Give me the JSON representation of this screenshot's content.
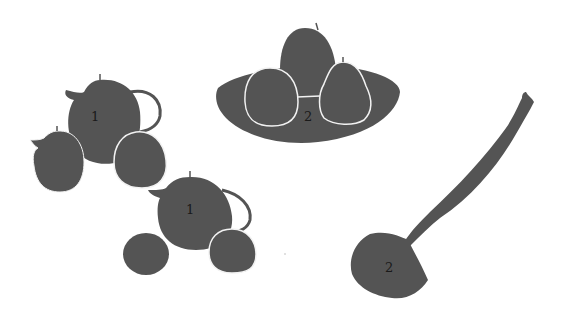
{
  "canvas": {
    "width": 571,
    "height": 321,
    "background": "#ffffff"
  },
  "colors": {
    "silhouette": "#545454",
    "outline": "#f2f2f2",
    "label": "#1a1a1a"
  },
  "groups": [
    {
      "id": "group-teapot-top-left",
      "label": "1"
    },
    {
      "id": "group-fruit-bowl",
      "label": "2"
    },
    {
      "id": "group-teapot-bottom",
      "label": "1"
    },
    {
      "id": "group-ladle",
      "label": "2"
    }
  ]
}
